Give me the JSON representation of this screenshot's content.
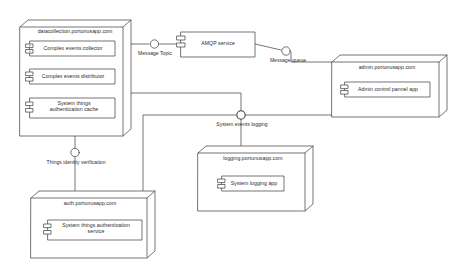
{
  "diagram": {
    "type": "uml-deployment-diagram",
    "stroke_color": "#3a3a3a",
    "text_color": "#2b2b2b",
    "background_color": "#ffffff",
    "node_fill": "#ffffff"
  },
  "nodes": [
    {
      "id": "datacollection",
      "name": "datacollection.portunusapp.com",
      "components": [
        {
          "id": "complex-events-collector",
          "label": "Complex events collector"
        },
        {
          "id": "complex-events-distributor",
          "label": "Complex events distributor"
        },
        {
          "id": "system-things-authentication-cache",
          "label": "System things\nauthentication cache"
        }
      ]
    },
    {
      "id": "admin",
      "name": "admin.portunusapp.com",
      "components": [
        {
          "id": "admin-control-pannel-app",
          "label": "Admin control pannel app"
        }
      ]
    },
    {
      "id": "logging",
      "name": "logging.portunusapp.com",
      "components": [
        {
          "id": "system-logging-app",
          "label": "System logging app"
        }
      ]
    },
    {
      "id": "auth",
      "name": "auth.portunusapp.com",
      "components": [
        {
          "id": "system-things-authentication-service",
          "label": "System things authentication\nservice"
        }
      ]
    }
  ],
  "standalone_components": [
    {
      "id": "amqp-service",
      "label": "AMQP service"
    }
  ],
  "interfaces": [
    {
      "id": "message-topic",
      "label": "Message Topic"
    },
    {
      "id": "message-queue",
      "label": "Message queue"
    },
    {
      "id": "system-events-logging",
      "label": "System events logging"
    },
    {
      "id": "things-identity-verification",
      "label": "Things identity verification"
    }
  ]
}
